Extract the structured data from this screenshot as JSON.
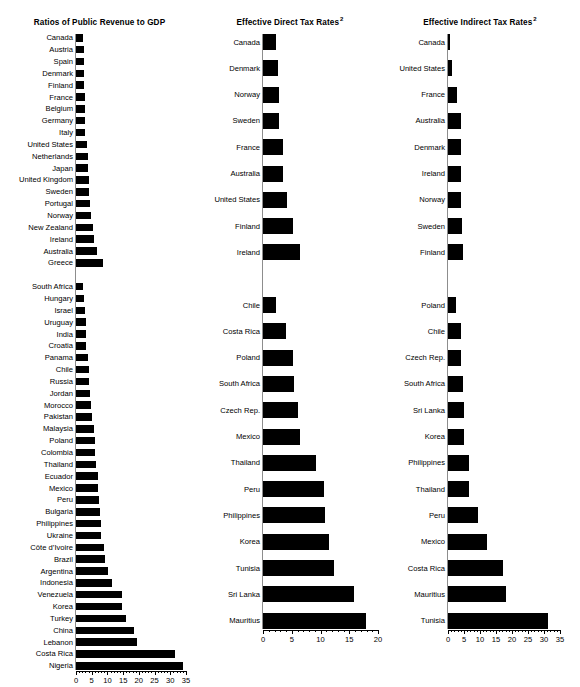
{
  "figure": {
    "width": 580,
    "height": 675,
    "background": "#ffffff",
    "bar_color": "#000000",
    "baseline_color": "#8d8d8d"
  },
  "chart_data": [
    {
      "type": "bar",
      "orientation": "horizontal",
      "title": "Ratios of Public Revenue to GDP",
      "title_superscript": "",
      "xlabel": "",
      "ylabel": "",
      "xlim": [
        0,
        35
      ],
      "grid": false,
      "legend": "none",
      "ticks": [
        0,
        5,
        10,
        15,
        20,
        25,
        30,
        35
      ],
      "tick_labels": [
        "0",
        "5",
        "10",
        "15",
        "20",
        "25",
        "30",
        "35"
      ],
      "minor_ticks": [
        1,
        2,
        3,
        4,
        6,
        7,
        8,
        9,
        11,
        12,
        13,
        14,
        16,
        17,
        18,
        19,
        21,
        22,
        23,
        24,
        26,
        27,
        28,
        29,
        31,
        32,
        33,
        34
      ],
      "groups": [
        {
          "name": "developed",
          "categories": [
            "Canada",
            "Austria",
            "Spain",
            "Denmark",
            "Finland",
            "France",
            "Belgium",
            "Germany",
            "Italy",
            "United States",
            "Netherlands",
            "Japan",
            "United Kingdom",
            "Sweden",
            "Portugal",
            "Norway",
            "New Zealand",
            "Ireland",
            "Australia",
            "Greece"
          ],
          "values": [
            2.3,
            2.4,
            2.5,
            2.6,
            2.6,
            2.8,
            2.9,
            3.0,
            3.0,
            3.6,
            3.8,
            3.9,
            4.1,
            4.2,
            4.4,
            4.7,
            5.4,
            5.7,
            6.8,
            8.7
          ]
        },
        {
          "name": "developing",
          "categories": [
            "South Africa",
            "Hungary",
            "Israel",
            "Uruguay",
            "India",
            "Croatia",
            "Panama",
            "Chile",
            "Russia",
            "Jordan",
            "Morocco",
            "Pakistan",
            "Malaysia",
            "Poland",
            "Colombia",
            "Thailand",
            "Ecuador",
            "Mexico",
            "Peru",
            "Bulgaria",
            "Philippines",
            "Ukraine",
            "Côte d’Ivoire",
            "Brazil",
            "Argentina",
            "Indonesia",
            "Venezuela",
            "Korea",
            "Turkey",
            "China",
            "Lebanon",
            "Costa Rica",
            "Nigeria"
          ],
          "values": [
            2.3,
            2.5,
            2.8,
            3.1,
            3.2,
            3.2,
            3.8,
            4.0,
            4.1,
            4.6,
            4.7,
            5.2,
            5.8,
            5.9,
            6.0,
            6.4,
            7.0,
            7.1,
            7.2,
            7.5,
            7.9,
            8.1,
            9.0,
            9.2,
            10.2,
            11.6,
            14.6,
            14.7,
            15.8,
            18.4,
            19.4,
            31.4,
            34.1
          ]
        }
      ]
    },
    {
      "type": "bar",
      "orientation": "horizontal",
      "title": "Effective Direct Tax Rates",
      "title_superscript": "2",
      "xlabel": "",
      "ylabel": "",
      "xlim": [
        0,
        20
      ],
      "grid": false,
      "legend": "none",
      "ticks": [
        0,
        5,
        10,
        15,
        20
      ],
      "tick_labels": [
        "0",
        "5",
        "10",
        "15",
        "20"
      ],
      "minor_ticks": [
        1,
        2,
        3,
        4,
        6,
        7,
        8,
        9,
        11,
        12,
        13,
        14,
        16,
        17,
        18,
        19
      ],
      "groups": [
        {
          "name": "developed",
          "categories": [
            "Canada",
            "Denmark",
            "Norway",
            "Sweden",
            "France",
            "Australia",
            "United States",
            "Finland",
            "Ireland"
          ],
          "values": [
            2.2,
            2.6,
            2.7,
            2.8,
            3.4,
            3.5,
            4.1,
            5.2,
            6.4
          ]
        },
        {
          "name": "developing",
          "categories": [
            "Chile",
            "Costa Rica",
            "Poland",
            "South Africa",
            "Czech Rep.",
            "Mexico",
            "Thailand",
            "Peru",
            "Philippines",
            "Korea",
            "Tunisia",
            "Sri Lanka",
            "Mauritius"
          ],
          "values": [
            2.2,
            4.0,
            5.2,
            5.4,
            6.0,
            6.5,
            9.2,
            10.6,
            10.8,
            11.4,
            12.3,
            15.9,
            17.9
          ]
        }
      ]
    },
    {
      "type": "bar",
      "orientation": "horizontal",
      "title": "Effective Indirect Tax Rates",
      "title_superscript": "2",
      "xlabel": "",
      "ylabel": "",
      "xlim": [
        0,
        35
      ],
      "grid": false,
      "legend": "none",
      "ticks": [
        0,
        5,
        10,
        15,
        20,
        25,
        30,
        35
      ],
      "tick_labels": [
        "0",
        "5",
        "10",
        "15",
        "20",
        "25",
        "30",
        "35"
      ],
      "minor_ticks": [
        1,
        2,
        3,
        4,
        6,
        7,
        8,
        9,
        11,
        12,
        13,
        14,
        16,
        17,
        18,
        19,
        21,
        22,
        23,
        24,
        26,
        27,
        28,
        29,
        31,
        32,
        33,
        34
      ],
      "groups": [
        {
          "name": "developed",
          "categories": [
            "Canada",
            "United States",
            "France",
            "Australia",
            "Denmark",
            "Ireland",
            "Norway",
            "Sweden",
            "Finland"
          ],
          "values": [
            0.5,
            1.2,
            2.9,
            4.0,
            4.1,
            4.1,
            4.2,
            4.3,
            4.8
          ]
        },
        {
          "name": "developing",
          "categories": [
            "Poland",
            "Chile",
            "Czech Rep.",
            "South Africa",
            "Sri Lanka",
            "Korea",
            "Philippines",
            "Thailand",
            "Peru",
            "Mexico",
            "Costa Rica",
            "Mauritius",
            "Tunisia"
          ],
          "values": [
            2.4,
            4.0,
            4.1,
            4.7,
            5.0,
            5.1,
            6.5,
            6.7,
            9.4,
            12.2,
            17.1,
            18.2,
            31.4
          ]
        }
      ]
    }
  ]
}
